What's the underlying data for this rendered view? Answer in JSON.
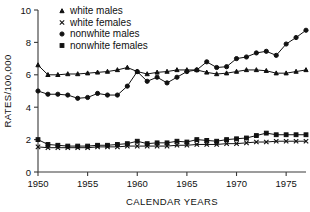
{
  "chart_data": {
    "type": "line",
    "title": "",
    "xlabel": "CALENDAR YEARS",
    "ylabel": "RATES/100,000",
    "xlim": [
      1950,
      1977
    ],
    "ylim": [
      0,
      10
    ],
    "xticks": [
      1950,
      1955,
      1960,
      1965,
      1970,
      1975
    ],
    "yticks": [
      0,
      2,
      4,
      6,
      8,
      10
    ],
    "grid": false,
    "legend_position": "top-left",
    "x": [
      1950,
      1951,
      1952,
      1953,
      1954,
      1955,
      1956,
      1957,
      1958,
      1959,
      1960,
      1961,
      1962,
      1963,
      1964,
      1965,
      1966,
      1967,
      1968,
      1969,
      1970,
      1971,
      1972,
      1973,
      1974,
      1975,
      1976,
      1977
    ],
    "series": [
      {
        "name": "white males",
        "marker": "triangle",
        "values": [
          6.6,
          6.0,
          6.0,
          6.05,
          6.05,
          6.1,
          6.15,
          6.2,
          6.3,
          6.45,
          6.2,
          6.05,
          6.15,
          6.2,
          6.3,
          6.3,
          6.3,
          6.15,
          6.05,
          6.1,
          6.2,
          6.3,
          6.3,
          6.25,
          6.1,
          6.1,
          6.2,
          6.3
        ]
      },
      {
        "name": "white females",
        "marker": "x",
        "values": [
          1.55,
          1.5,
          1.5,
          1.5,
          1.5,
          1.5,
          1.55,
          1.55,
          1.55,
          1.6,
          1.6,
          1.6,
          1.6,
          1.6,
          1.65,
          1.65,
          1.7,
          1.7,
          1.7,
          1.75,
          1.75,
          1.8,
          1.85,
          1.85,
          1.9,
          1.9,
          1.9,
          1.9
        ]
      },
      {
        "name": "nonwhite males",
        "marker": "circle",
        "values": [
          5.0,
          4.8,
          4.8,
          4.75,
          4.55,
          4.6,
          4.85,
          4.75,
          4.75,
          5.3,
          6.2,
          5.6,
          5.85,
          5.5,
          5.85,
          6.2,
          6.3,
          6.8,
          6.45,
          6.5,
          7.0,
          7.1,
          7.35,
          7.45,
          7.2,
          7.9,
          8.3,
          8.75
        ]
      },
      {
        "name": "nonwhite females",
        "marker": "square",
        "values": [
          2.0,
          1.7,
          1.65,
          1.6,
          1.6,
          1.6,
          1.65,
          1.65,
          1.7,
          1.75,
          1.9,
          1.75,
          1.8,
          1.8,
          1.9,
          1.85,
          2.0,
          1.95,
          1.9,
          2.0,
          2.05,
          2.1,
          2.25,
          2.4,
          2.3,
          2.3,
          2.3,
          2.3
        ]
      }
    ]
  },
  "legend": {
    "items": [
      {
        "label": "white males"
      },
      {
        "label": "white females"
      },
      {
        "label": "nonwhite males"
      },
      {
        "label": "nonwhite females"
      }
    ]
  }
}
